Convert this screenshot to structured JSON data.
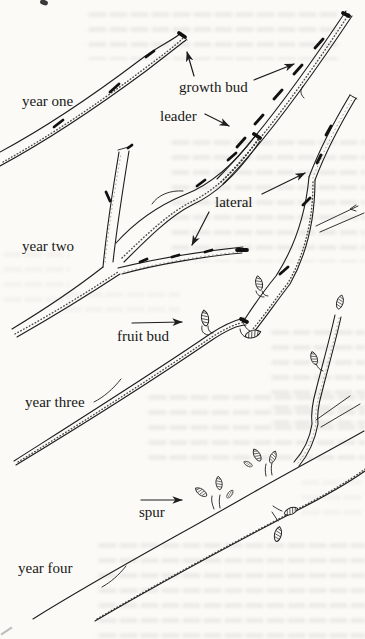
{
  "figure": {
    "paper_color": "#fbfaf6",
    "ink_color": "#1d1d1d",
    "stage_labels": {
      "year_one": "year one",
      "year_two": "year two",
      "year_three": "year three",
      "year_four": "year four"
    },
    "annotations": {
      "growth_bud": "growth bud",
      "leader": "leader",
      "lateral": "lateral",
      "fruit_bud": "fruit bud",
      "spur": "spur"
    }
  }
}
